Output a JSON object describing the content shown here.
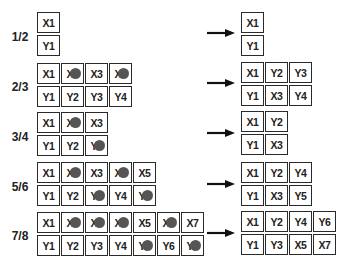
{
  "colors": {
    "cell_border": "#2a2a2a",
    "puncture_dot": "#555555",
    "text": "#222222"
  },
  "rows": [
    {
      "rate": "1/2",
      "mother": {
        "top": [
          {
            "label": "X1",
            "punctured": false
          }
        ],
        "bottom": [
          {
            "label": "Y1",
            "punctured": false
          }
        ]
      },
      "output": {
        "top": [
          "X1"
        ],
        "bottom": [
          "Y1"
        ]
      }
    },
    {
      "rate": "2/3",
      "mother": {
        "top": [
          {
            "label": "X1",
            "punctured": false
          },
          {
            "label": "X2",
            "punctured": true
          },
          {
            "label": "X3",
            "punctured": false
          },
          {
            "label": "X4",
            "punctured": true
          }
        ],
        "bottom": [
          {
            "label": "Y1",
            "punctured": false
          },
          {
            "label": "Y2",
            "punctured": false
          },
          {
            "label": "Y3",
            "punctured": false
          },
          {
            "label": "Y4",
            "punctured": false
          }
        ]
      },
      "output": {
        "top": [
          "X1",
          "Y2",
          "Y3"
        ],
        "bottom": [
          "Y1",
          "X3",
          "Y4"
        ]
      }
    },
    {
      "rate": "3/4",
      "mother": {
        "top": [
          {
            "label": "X1",
            "punctured": false
          },
          {
            "label": "X2",
            "punctured": true
          },
          {
            "label": "X3",
            "punctured": false
          }
        ],
        "bottom": [
          {
            "label": "Y1",
            "punctured": false
          },
          {
            "label": "Y2",
            "punctured": false
          },
          {
            "label": "Y3",
            "punctured": true
          }
        ]
      },
      "output": {
        "top": [
          "X1",
          "Y2"
        ],
        "bottom": [
          "Y1",
          "X3"
        ]
      }
    },
    {
      "rate": "5/6",
      "mother": {
        "top": [
          {
            "label": "X1",
            "punctured": false
          },
          {
            "label": "X2",
            "punctured": true
          },
          {
            "label": "X3",
            "punctured": false
          },
          {
            "label": "X4",
            "punctured": true
          },
          {
            "label": "X5",
            "punctured": false
          }
        ],
        "bottom": [
          {
            "label": "Y1",
            "punctured": false
          },
          {
            "label": "Y2",
            "punctured": false
          },
          {
            "label": "Y3",
            "punctured": true
          },
          {
            "label": "Y4",
            "punctured": false
          },
          {
            "label": "Y5",
            "punctured": true
          }
        ]
      },
      "output": {
        "top": [
          "X1",
          "Y2",
          "Y4"
        ],
        "bottom": [
          "Y1",
          "X3",
          "Y5"
        ]
      }
    },
    {
      "rate": "7/8",
      "mother": {
        "top": [
          {
            "label": "X1",
            "punctured": false
          },
          {
            "label": "X2",
            "punctured": true
          },
          {
            "label": "X3",
            "punctured": true
          },
          {
            "label": "X4",
            "punctured": true
          },
          {
            "label": "X5",
            "punctured": false
          },
          {
            "label": "X6",
            "punctured": true
          },
          {
            "label": "X7",
            "punctured": false
          }
        ],
        "bottom": [
          {
            "label": "Y1",
            "punctured": false
          },
          {
            "label": "Y2",
            "punctured": false
          },
          {
            "label": "Y3",
            "punctured": false
          },
          {
            "label": "Y4",
            "punctured": false
          },
          {
            "label": "Y5",
            "punctured": true
          },
          {
            "label": "Y6",
            "punctured": false
          },
          {
            "label": "Y7",
            "punctured": true
          }
        ]
      },
      "output": {
        "top": [
          "X1",
          "Y2",
          "Y4",
          "Y6"
        ],
        "bottom": [
          "Y1",
          "Y3",
          "X5",
          "X7"
        ]
      }
    }
  ]
}
